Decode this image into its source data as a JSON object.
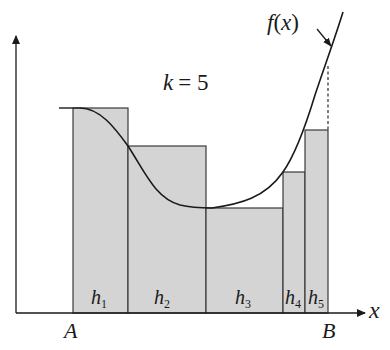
{
  "diagram": {
    "title_label": "k = 5",
    "k_var": "k",
    "k_eq": "= 5",
    "function_label_f": "f",
    "function_label_paren": "(x)",
    "function_label_x": "x",
    "x_axis_label": "x",
    "interval_start_label": "A",
    "interval_end_label": "B",
    "bars": [
      {
        "name": "h",
        "sub": "1"
      },
      {
        "name": "h",
        "sub": "2"
      },
      {
        "name": "h",
        "sub": "3"
      },
      {
        "name": "h",
        "sub": "4"
      },
      {
        "name": "h",
        "sub": "5"
      }
    ],
    "colors": {
      "bar_fill": "#d4d4d4",
      "stroke": "#2a2a2a",
      "background": "#ffffff"
    }
  }
}
